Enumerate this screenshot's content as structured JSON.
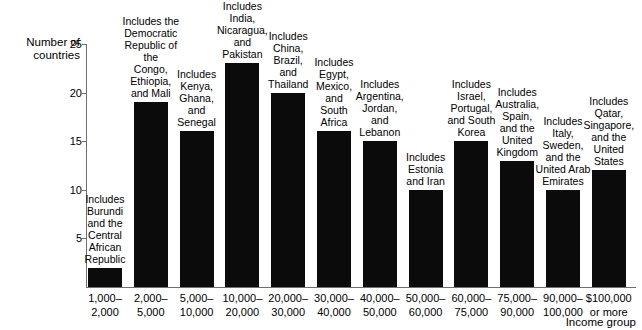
{
  "chart_data": {
    "type": "bar",
    "title": "",
    "xlabel": "Income group",
    "ylabel": "Number of\ncountries",
    "ylim": [
      0,
      25
    ],
    "yticks": [
      5,
      10,
      15,
      20,
      25
    ],
    "grid": false,
    "legend": "none",
    "categories": [
      "1,000–\n2,000",
      "2,000–\n5,000",
      "5,000–\n10,000",
      "10,000–\n20,000",
      "20,000–\n30,000",
      "30,000–\n40,000",
      "40,000–\n50,000",
      "50,000–\n60,000",
      "60,000–\n75,000",
      "75,000–\n90,000",
      "90,000–\n100,000",
      "$100,000\nor more"
    ],
    "values": [
      2,
      19,
      16,
      23,
      20,
      16,
      15,
      10,
      15,
      13,
      10,
      12
    ],
    "annotations": [
      "Includes\nBurundi\nand the\nCentral\nAfrican\nRepublic",
      "Includes the\nDemocratic\nRepublic of the\nCongo,\nEthiopia,\nand Mali",
      "Includes\nKenya,\nGhana,\nand\nSenegal",
      "Includes\nIndia,\nNicaragua,\nand\nPakistan",
      "Includes\nChina,\nBrazil,\nand\nThailand",
      "Includes\nEgypt,\nMexico,\nand\nSouth\nAfrica",
      "Includes\nArgentina,\nJordan,\nand\nLebanon",
      "Includes\nEstonia\nand Iran",
      "Includes\nIsrael,\nPortugal,\nand South\nKorea",
      "Includes\nAustralia,\nSpain,\nand the\nUnited\nKingdom",
      "Includes\nItaly,\nSweden,\nand the\nUnited Arab\nEmirates",
      "Includes\nQatar,\nSingapore,\nand the\nUnited\nStates"
    ],
    "bar_color": "#0b0b0b",
    "axis_color": "#6f6f6f"
  }
}
